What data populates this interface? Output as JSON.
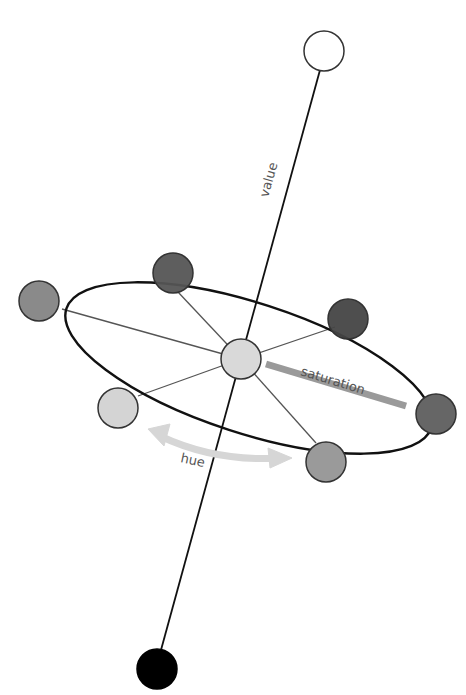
{
  "diagram": {
    "labels": {
      "value": "value",
      "saturation": "saturation",
      "hue": "hue"
    },
    "axis": {
      "top": [
        324,
        51
      ],
      "bottom": [
        157,
        669
      ],
      "color": "#111111"
    },
    "ellipse": {
      "cx": 241,
      "cy": 359,
      "rx": 192,
      "ry": 68,
      "rotate": 18,
      "stroke": "#111111"
    },
    "center_node": {
      "cx": 241,
      "cy": 359,
      "fill": "#d9d9d9"
    },
    "nodes": [
      {
        "name": "white",
        "cx": 324,
        "cy": 51,
        "fill": "#ffffff"
      },
      {
        "name": "black",
        "cx": 157,
        "cy": 669,
        "fill": "#000000"
      },
      {
        "name": "top-dark",
        "cx": 173,
        "cy": 273,
        "fill": "#555555"
      },
      {
        "name": "right-dark",
        "cx": 348,
        "cy": 319,
        "fill": "#444444"
      },
      {
        "name": "left-mid",
        "cx": 39,
        "cy": 301,
        "fill": "#8a8a8a"
      },
      {
        "name": "lower-left-light",
        "cx": 118,
        "cy": 408,
        "fill": "#d4d4d4"
      },
      {
        "name": "bottom-right",
        "cx": 326,
        "cy": 462,
        "fill": "#9a9a9a"
      },
      {
        "name": "far-right",
        "cx": 436,
        "cy": 414,
        "fill": "#666666"
      }
    ],
    "colors": {
      "saturation_bar": "#9a9a9a",
      "hue_arrow": "#d6d6d6"
    }
  }
}
